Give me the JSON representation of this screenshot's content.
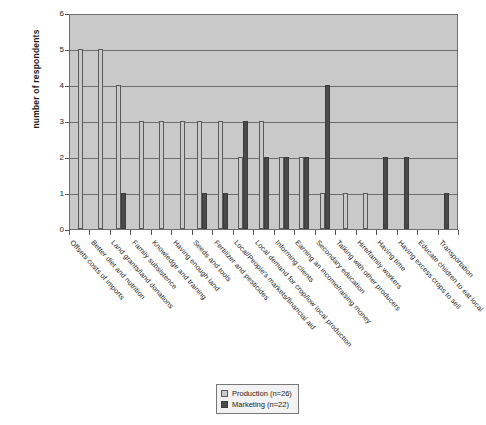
{
  "chart_data": {
    "type": "bar",
    "title": "",
    "xlabel": "",
    "ylabel": "number of respondents",
    "ylim": [
      0,
      6
    ],
    "yticks": [
      0,
      1,
      2,
      3,
      4,
      5,
      6
    ],
    "grid": true,
    "legend_position": "bottom-center",
    "categories": [
      "Offsets costs of imports",
      "Better diet and nutrition",
      "Land grants/land donations",
      "Family subsistence",
      "Knowledge and training",
      "Having enough land",
      "Seeds and tools",
      "Fertilizer and pesticides",
      "Local/People's markets/financial aid",
      "Local demand for crop/low local production",
      "Informing clients",
      "Earning an income/raising money",
      "Secondary education",
      "Talking with other producers",
      "Hire/family workers",
      "Having time",
      "Having excess crops to sell",
      "Educate children to eat local",
      "Transportation"
    ],
    "series": [
      {
        "name": "Production (n=26)",
        "color": "#c9c9c9",
        "values": [
          5,
          5,
          4,
          3,
          3,
          3,
          3,
          3,
          2,
          3,
          2,
          2,
          1,
          1,
          1,
          0,
          0,
          0,
          0
        ]
      },
      {
        "name": "Marketing (n=22)",
        "color": "#4a4a4a",
        "values": [
          0,
          0,
          1,
          0,
          0,
          0,
          1,
          1,
          3,
          2,
          2,
          2,
          4,
          0,
          0,
          2,
          2,
          0,
          1
        ]
      }
    ]
  },
  "legend": {
    "items": [
      {
        "label": "Production (n=26)",
        "key": "production"
      },
      {
        "label": "Marketing (n=22)",
        "key": "marketing"
      }
    ]
  },
  "axis": {
    "y_title": "number of respondents"
  }
}
